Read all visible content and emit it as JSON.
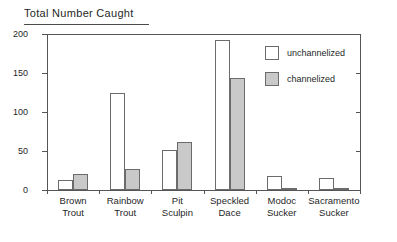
{
  "chart_data": {
    "type": "bar",
    "title": "Total Number Caught",
    "xlabel": "",
    "ylabel": "",
    "ylim": [
      0,
      200
    ],
    "yticks": [
      0,
      50,
      100,
      150,
      200
    ],
    "ytick_labels": [
      "0",
      "50",
      "100",
      "150",
      "200"
    ],
    "grid": false,
    "legend_position": "upper right inside plot",
    "right_axis_ticks_unlabeled": [
      50,
      100,
      150
    ],
    "categories": [
      "Brown Trout",
      "Rainbow Trout",
      "Pit Sculpin",
      "Speckled Dace",
      "Modoc Sucker",
      "Sacramento Sucker"
    ],
    "category_lines": [
      [
        "Brown",
        "Trout"
      ],
      [
        "Rainbow",
        "Trout"
      ],
      [
        "Pit",
        "Sculpin"
      ],
      [
        "Speckled",
        "Dace"
      ],
      [
        "Modoc",
        "Sucker"
      ],
      [
        "Sacramento",
        "Sucker"
      ]
    ],
    "series": [
      {
        "name": "unchannelized",
        "color": "#ffffff",
        "values": [
          13,
          125,
          51,
          192,
          18,
          15
        ]
      },
      {
        "name": "channelized",
        "color": "#c9c9c9",
        "values": [
          21,
          27,
          62,
          143,
          2,
          3
        ]
      }
    ]
  },
  "legend": {
    "items": [
      {
        "label": "unchannelized",
        "swatch": "unch"
      },
      {
        "label": "channelized",
        "swatch": "ch"
      }
    ]
  },
  "colors": {
    "unchannelized_fill": "#ffffff",
    "channelized_fill": "#c9c9c9",
    "bar_stroke": "#6b6b6b",
    "axis": "#555555",
    "text": "#1f1f1f"
  }
}
